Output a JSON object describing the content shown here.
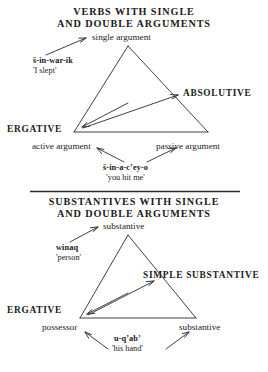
{
  "figure": {
    "divider": "section-divider-rule"
  },
  "sections": [
    {
      "id": "verbs",
      "title_line1": "VERBS WITH SINGLE",
      "title_line2": "AND DOUBLE ARGUMENTS",
      "apex_label": "single argument",
      "right_caps_label": "ABSOLUTIVE",
      "left_caps_label": "ERGATIVE",
      "base_left_label": "active argument",
      "base_right_label": "passive argument",
      "example_single": {
        "form": "š-in-war-ik",
        "meaning": "'I slept'"
      },
      "example_double": {
        "form": "š-in-a-cʼey-o",
        "meaning": "'you hit me'"
      }
    },
    {
      "id": "substantives",
      "title_line1": "SUBSTANTIVES WITH SINGLE",
      "title_line2": "AND DOUBLE ARGUMENTS",
      "apex_label": "substantive",
      "right_caps_label": "SIMPLE SUBSTANTIVE",
      "left_caps_label": "ERGATIVE",
      "base_left_label": "possessor",
      "base_right_label": "substantive",
      "example_single": {
        "form": "winaq",
        "meaning": "'person'"
      },
      "example_double": {
        "form": "u-qʼabʼ",
        "meaning": "'his hand'"
      }
    }
  ],
  "colors": {
    "ink": "#1a1a1a",
    "line": "#2b2b2b",
    "background": "#ffffff"
  }
}
